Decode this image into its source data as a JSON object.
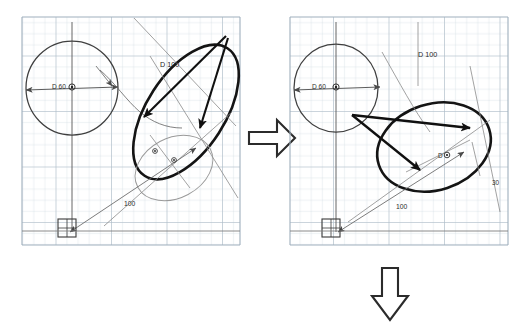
{
  "document": {
    "title": "Geometric construction worksheet (scanned graph paper)",
    "background_color": "#ffffff",
    "grid_color": "#c9d4dd",
    "grid_major_color": "#a8b6c2",
    "ink_color": "#3b3b3b",
    "bold_ink_color": "#1a1a1a",
    "arrow_outline_color": "#2b2b2b",
    "arrow_fill_color": "#ffffff"
  },
  "panels": [
    {
      "id": "left-panel",
      "name": "before-construction",
      "grid": {
        "x": 22,
        "y": 17,
        "width": 218,
        "height": 228,
        "cell": 11.1
      },
      "labels": [
        {
          "id": "d60",
          "text": "D 60",
          "x": 52,
          "y": 89
        },
        {
          "id": "d100",
          "text": "D 100",
          "x": 160,
          "y": 67
        },
        {
          "id": "dim100",
          "text": "100",
          "x": 124,
          "y": 206
        }
      ],
      "markers": [
        {
          "id": "circle-center",
          "kind": "center-point",
          "x": 72,
          "y": 87
        },
        {
          "id": "small-center-a",
          "kind": "center-point",
          "x": 155,
          "y": 151
        },
        {
          "id": "small-center-b",
          "kind": "center-point",
          "x": 174,
          "y": 160
        },
        {
          "id": "datum-square",
          "kind": "datum-square",
          "x": 66,
          "y": 228
        }
      ]
    },
    {
      "id": "right-panel",
      "name": "after-construction",
      "grid": {
        "x": 290,
        "y": 17,
        "width": 218,
        "height": 228,
        "cell": 11.1
      },
      "labels": [
        {
          "id": "d60",
          "text": "D 60",
          "x": 312,
          "y": 89
        },
        {
          "id": "d100",
          "text": "D 100",
          "x": 418,
          "y": 57
        },
        {
          "id": "dim100",
          "text": "100",
          "x": 396,
          "y": 209
        },
        {
          "id": "d-small",
          "text": "D",
          "x": 438,
          "y": 158
        },
        {
          "id": "angle30",
          "text": "30",
          "x": 492,
          "y": 185
        }
      ],
      "markers": [
        {
          "id": "circle-center",
          "kind": "center-point",
          "x": 336,
          "y": 87
        },
        {
          "id": "ellipse-center",
          "kind": "center-point",
          "x": 447,
          "y": 155
        },
        {
          "id": "datum-square",
          "kind": "datum-square",
          "x": 330,
          "y": 228
        }
      ]
    }
  ],
  "flow_arrows": [
    {
      "id": "right-arrow",
      "name": "step-arrow-right",
      "direction": "right",
      "x": 249,
      "y": 120,
      "width": 46,
      "height": 36
    },
    {
      "id": "down-arrow",
      "name": "step-arrow-down",
      "direction": "down",
      "x": 372,
      "y": 268,
      "width": 36,
      "height": 52
    }
  ]
}
